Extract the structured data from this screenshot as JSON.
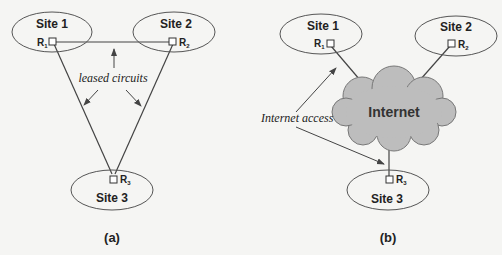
{
  "colors": {
    "background": "#f5f5f3",
    "stroke": "#444444",
    "cloud_fill": "#bdbdbd",
    "text": "#222222"
  },
  "panel_a": {
    "caption": "(a)",
    "sites": [
      {
        "label": "Site 1",
        "router": "R",
        "router_sub": "1"
      },
      {
        "label": "Site 2",
        "router": "R",
        "router_sub": "2"
      },
      {
        "label": "Site 3",
        "router": "R",
        "router_sub": "3"
      }
    ],
    "annotation": "leased circuits"
  },
  "panel_b": {
    "caption": "(b)",
    "sites": [
      {
        "label": "Site 1",
        "router": "R",
        "router_sub": "1"
      },
      {
        "label": "Site 2",
        "router": "R",
        "router_sub": "2"
      },
      {
        "label": "Site 3",
        "router": "R",
        "router_sub": "3"
      }
    ],
    "cloud_label": "Internet",
    "annotation": "Internet access"
  }
}
